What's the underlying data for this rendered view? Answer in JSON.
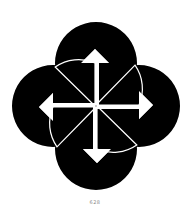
{
  "figure": {
    "colors": {
      "ink": "#000000",
      "paper": "#ffffff",
      "caption": "#8a8a8a"
    },
    "units": [
      {
        "direction": "up",
        "icon": "arrow-up-icon"
      },
      {
        "direction": "right",
        "icon": "arrow-right-icon"
      },
      {
        "direction": "down",
        "icon": "arrow-down-icon"
      },
      {
        "direction": "left",
        "icon": "arrow-left-icon"
      }
    ]
  },
  "caption": "628"
}
